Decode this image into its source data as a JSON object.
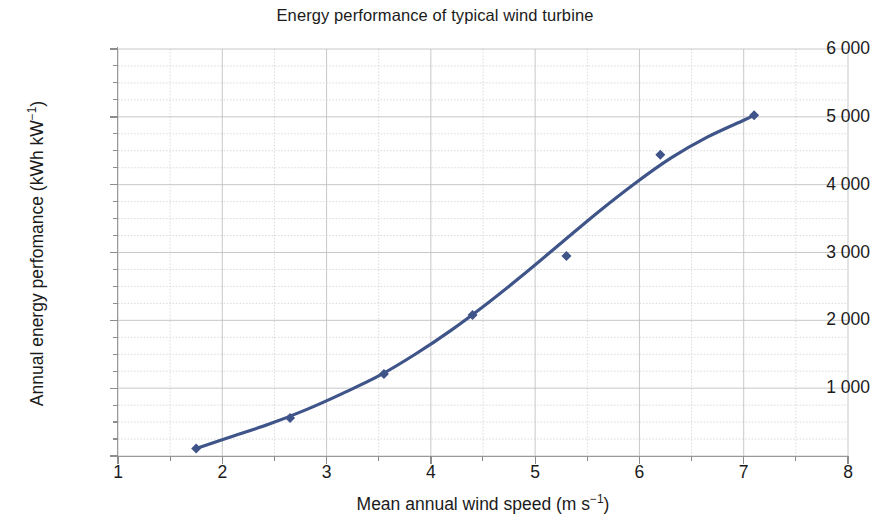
{
  "chart_data": {
    "type": "scatter",
    "title": "Energy performance of typical wind turbine",
    "xlabel_text": "Mean annual wind speed (m s",
    "xlabel_exp": "−1",
    "xlabel_tail": ")",
    "xlabel_full": "Mean annual wind speed (m s⁻¹)",
    "ylabel_text": "Annual energy perfomance (kWh kW",
    "ylabel_exp": "−1",
    "ylabel_tail": ")",
    "ylabel_full": "Annual energy perfomance (kWh kW⁻¹)",
    "xlim": [
      1,
      8
    ],
    "ylim": [
      0,
      6000
    ],
    "x_major_step": 1,
    "x_minor_step": 0.5,
    "y_major_step": 1000,
    "y_minor_step": 250,
    "grid": true,
    "grid_style": "major solid light-grey, minor dotted light-grey",
    "legend": "none",
    "series_color": "#3f5488",
    "marker_shape": "diamond",
    "x_tick_labels": [
      "1",
      "2",
      "3",
      "4",
      "5",
      "6",
      "7",
      "8"
    ],
    "x_tick_values": [
      1,
      2,
      3,
      4,
      5,
      6,
      7,
      8
    ],
    "y_tick_labels": [
      "6 000",
      "5 000",
      "4 000",
      "3 000",
      "2 000",
      "1 000"
    ],
    "y_tick_values": [
      6000,
      5000,
      4000,
      3000,
      2000,
      1000
    ],
    "series": [
      {
        "name": "Annual energy performance",
        "x": [
          1.75,
          2.65,
          3.55,
          4.4,
          5.3,
          6.2,
          7.1
        ],
        "values": [
          110,
          560,
          1210,
          2080,
          2950,
          4440,
          5025
        ]
      }
    ],
    "trend_line": {
      "name": "fitted curve",
      "x": [
        1.75,
        2.1,
        2.45,
        2.8,
        3.15,
        3.5,
        3.85,
        4.2,
        4.55,
        4.9,
        5.25,
        5.6,
        5.95,
        6.3,
        6.65,
        7.0,
        7.1
      ],
      "values": [
        110,
        290,
        470,
        680,
        920,
        1180,
        1500,
        1860,
        2260,
        2690,
        3140,
        3590,
        4010,
        4390,
        4700,
        4950,
        5025
      ]
    }
  }
}
